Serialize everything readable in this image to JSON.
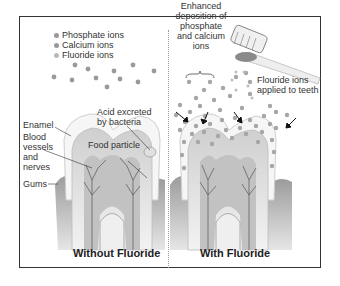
{
  "legend": {
    "items": [
      {
        "label": "Phosphate ions",
        "color": "#8f8f8f"
      },
      {
        "label": "Calcium ions",
        "color": "#9a9a9a"
      },
      {
        "label": "Fluoride ions",
        "color": "#b0b0b0"
      }
    ]
  },
  "left_panel": {
    "caption": "Without Fluoride",
    "labels": {
      "enamel": "Enamel",
      "blood_vessels": [
        "Blood",
        "vessels",
        "and",
        "nerves"
      ],
      "gums": "Gums",
      "acid": [
        "Acid excreted",
        "by bacteria"
      ],
      "food_particle": "Food particle"
    }
  },
  "right_panel": {
    "caption": "With Fluoride",
    "labels": {
      "enhanced": [
        "Enhanced",
        "deposition of",
        "phosphate",
        "and calcium",
        "ions"
      ],
      "fluoride_applied": [
        "Flouride ions",
        "applied to teeth"
      ]
    }
  },
  "colors": {
    "frame": "#333333",
    "ion": "#999999",
    "gum": "#a8a8a8",
    "enamel": "#f4f4f4",
    "dentin": "#d8d8d8",
    "nerve": "#555555"
  }
}
